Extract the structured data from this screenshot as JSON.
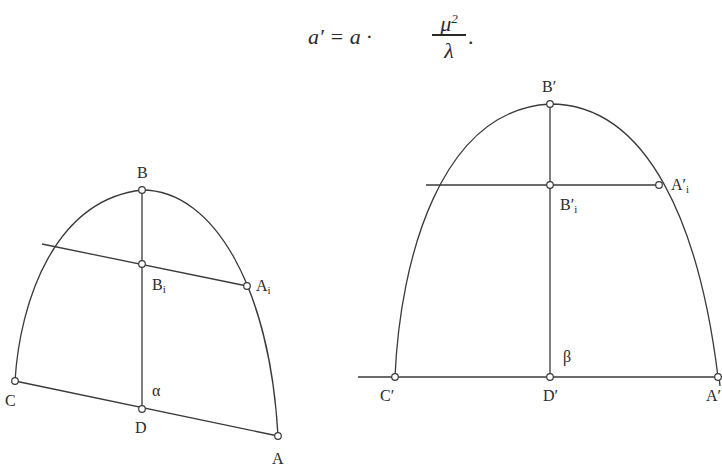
{
  "formula": {
    "lhs": "a′ = a  ·",
    "numerator": "μ",
    "numerator_power": "2",
    "denominator": "λ",
    "trailing": "."
  },
  "left_figure": {
    "labels": {
      "B": "B",
      "Bi": "B",
      "Bi_sub": "i",
      "Ai": "A",
      "Ai_sub": "i",
      "C": "C",
      "D": "D",
      "A": "A",
      "angle": "α"
    }
  },
  "right_figure": {
    "labels": {
      "B": "B′",
      "Bi": "B′",
      "Bi_sub": "i",
      "Ai": "A′",
      "Ai_sub": "i",
      "C": "C′",
      "D": "D′",
      "A": "A′",
      "angle": "β"
    }
  },
  "colors": {
    "stroke": "#3a3a3a",
    "background": "#ffffff"
  }
}
